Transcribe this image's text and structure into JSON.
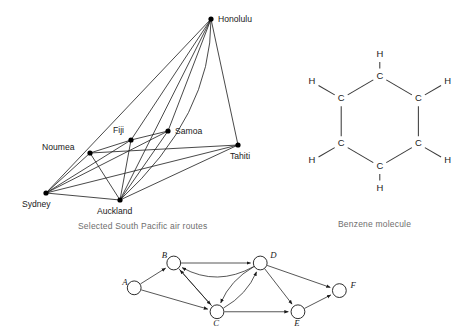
{
  "figure": {
    "panels": [
      "south-pacific-air-routes",
      "benzene-molecule",
      "directed-graph"
    ]
  },
  "map": {
    "caption": "Selected South Pacific air routes",
    "nodes": [
      {
        "id": "honolulu",
        "label": "Honolulu",
        "x": 211,
        "y": 19,
        "lx": 218,
        "ly": 22,
        "anchor": "start"
      },
      {
        "id": "samoa",
        "label": "Samoa",
        "x": 168,
        "y": 131,
        "lx": 175,
        "ly": 134,
        "anchor": "start"
      },
      {
        "id": "fiji",
        "label": "Fiji",
        "x": 131,
        "y": 140,
        "lx": 113,
        "ly": 133,
        "anchor": "start"
      },
      {
        "id": "tahiti",
        "label": "Tahiti",
        "x": 238,
        "y": 145,
        "lx": 230,
        "ly": 159,
        "anchor": "start"
      },
      {
        "id": "noumea",
        "label": "Noumea",
        "x": 90,
        "y": 153,
        "lx": 42,
        "ly": 150,
        "anchor": "start"
      },
      {
        "id": "sydney",
        "label": "Sydney",
        "x": 46,
        "y": 193,
        "lx": 22,
        "ly": 207,
        "anchor": "start"
      },
      {
        "id": "auckland",
        "label": "Auckland",
        "x": 120,
        "y": 200,
        "lx": 97,
        "ly": 214,
        "anchor": "start"
      }
    ],
    "edges": [
      {
        "from": "honolulu",
        "to": "sydney"
      },
      {
        "from": "honolulu",
        "to": "fiji"
      },
      {
        "from": "honolulu",
        "to": "samoa"
      },
      {
        "from": "honolulu",
        "to": "auckland"
      },
      {
        "from": "honolulu",
        "to": "tahiti"
      },
      {
        "from": "sydney",
        "to": "noumea"
      },
      {
        "from": "sydney",
        "to": "fiji"
      },
      {
        "from": "sydney",
        "to": "samoa"
      },
      {
        "from": "sydney",
        "to": "auckland"
      },
      {
        "from": "sydney",
        "to": "tahiti"
      },
      {
        "from": "noumea",
        "to": "auckland"
      },
      {
        "from": "noumea",
        "to": "fiji"
      },
      {
        "from": "fiji",
        "to": "samoa"
      },
      {
        "from": "fiji",
        "to": "auckland"
      },
      {
        "from": "samoa",
        "to": "auckland"
      },
      {
        "from": "auckland",
        "to": "tahiti"
      },
      {
        "from": "noumea",
        "to": "tahiti"
      }
    ],
    "curved_edges": [
      {
        "from": "honolulu",
        "to": "auckland",
        "label": "honolulu-auckland-curved"
      }
    ]
  },
  "benzene": {
    "caption": "Benzene molecule",
    "carbon_label": "C",
    "hydrogen_label": "H",
    "carbons": [
      {
        "id": "c1",
        "label": "C",
        "x": 86,
        "y": 23
      },
      {
        "id": "c2",
        "label": "C",
        "x": 127,
        "y": 47
      },
      {
        "id": "c3",
        "label": "C",
        "x": 127,
        "y": 95
      },
      {
        "id": "c4",
        "label": "C",
        "x": 86,
        "y": 119
      },
      {
        "id": "c5",
        "label": "C",
        "x": 45,
        "y": 95
      },
      {
        "id": "c6",
        "label": "C",
        "x": 45,
        "y": 47
      }
    ],
    "hydrogens": [
      {
        "id": "h1",
        "label": "H",
        "x": 86,
        "y": 0,
        "bond_to": "c1"
      },
      {
        "id": "h2",
        "label": "H",
        "x": 158,
        "y": 29,
        "bond_to": "c2"
      },
      {
        "id": "h3",
        "label": "H",
        "x": 158,
        "y": 113,
        "bond_to": "c3"
      },
      {
        "id": "h4",
        "label": "H",
        "x": 86,
        "y": 142,
        "bond_to": "c4"
      },
      {
        "id": "h5",
        "label": "H",
        "x": 14,
        "y": 113,
        "bond_to": "c5"
      },
      {
        "id": "h6",
        "label": "H",
        "x": 14,
        "y": 29,
        "bond_to": "c6"
      }
    ],
    "ring_bonds": [
      {
        "from": "c1",
        "to": "c2"
      },
      {
        "from": "c2",
        "to": "c3"
      },
      {
        "from": "c3",
        "to": "c4"
      },
      {
        "from": "c4",
        "to": "c5"
      },
      {
        "from": "c5",
        "to": "c6"
      },
      {
        "from": "c6",
        "to": "c1"
      }
    ]
  },
  "digraph": {
    "nodes": [
      {
        "id": "A",
        "label": "A",
        "x": 30,
        "y": 52,
        "lx": 17,
        "ly": 49
      },
      {
        "id": "B",
        "label": "B",
        "x": 73,
        "y": 25,
        "lx": 60,
        "ly": 20
      },
      {
        "id": "C",
        "label": "C",
        "x": 120,
        "y": 78,
        "lx": 116,
        "ly": 94
      },
      {
        "id": "D",
        "label": "D",
        "x": 167,
        "y": 25,
        "lx": 178,
        "ly": 20
      },
      {
        "id": "E",
        "label": "E",
        "x": 208,
        "y": 78,
        "lx": 204,
        "ly": 94
      },
      {
        "id": "F",
        "label": "F",
        "x": 253,
        "y": 55,
        "lx": 265,
        "ly": 52
      }
    ],
    "node_radius": 7.5,
    "edges": [
      {
        "from": "A",
        "to": "B",
        "curve": 0,
        "name": "edge-a-b"
      },
      {
        "from": "A",
        "to": "C",
        "curve": 0,
        "name": "edge-a-c"
      },
      {
        "from": "B",
        "to": "D",
        "curve": 0,
        "name": "edge-b-d"
      },
      {
        "from": "B",
        "to": "C",
        "curve": 0,
        "name": "edge-b-c"
      },
      {
        "from": "C",
        "to": "B",
        "curve": 0,
        "name": "edge-c-b"
      },
      {
        "from": "D",
        "to": "B",
        "curve": -26,
        "name": "edge-d-b-curved"
      },
      {
        "from": "C",
        "to": "D",
        "curve": 12,
        "name": "edge-c-d"
      },
      {
        "from": "D",
        "to": "C",
        "curve": 12,
        "name": "edge-d-c"
      },
      {
        "from": "C",
        "to": "E",
        "curve": 0,
        "name": "edge-c-e"
      },
      {
        "from": "D",
        "to": "E",
        "curve": 0,
        "name": "edge-d-e"
      },
      {
        "from": "D",
        "to": "F",
        "curve": 0,
        "name": "edge-d-f"
      },
      {
        "from": "E",
        "to": "F",
        "curve": 0,
        "name": "edge-e-f"
      }
    ]
  },
  "colors": {
    "ink": "#1a1a1a",
    "bond": "#3a3a3a",
    "caption": "#6e6e6e",
    "background": "#ffffff"
  }
}
